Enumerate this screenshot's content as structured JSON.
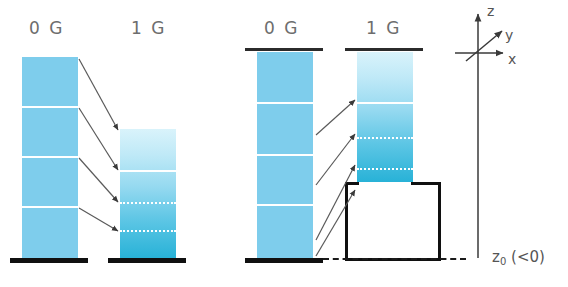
{
  "colors": {
    "zero_g_fill": "#7ecdec",
    "one_g_top": "#d9f3fb",
    "one_g_bottom": "#28b2d7",
    "divider": "#ffffff",
    "plate": "#101010",
    "label_text": "#6d6d6d",
    "axis_text": "#555555",
    "arrow": "#4a4a4a"
  },
  "panels": [
    {
      "id": "left-panel",
      "columns": [
        {
          "id": "left-0g",
          "label": "0 G",
          "style": "flat",
          "segments": 4,
          "divider_style": "solid",
          "has_top_plate": false,
          "has_base_plate": true
        },
        {
          "id": "left-1g",
          "label": "1 G",
          "style": "gradient",
          "segments": 4,
          "divider_style": "mixed",
          "has_top_plate": false,
          "has_base_plate": true
        }
      ],
      "arrows": 4
    },
    {
      "id": "right-panel",
      "columns": [
        {
          "id": "right-0g",
          "label": "0 G",
          "style": "flat",
          "segments": 4,
          "divider_style": "solid",
          "has_top_plate": true,
          "has_base_plate": true
        },
        {
          "id": "right-1g",
          "label": "1 G",
          "style": "gradient",
          "segments": 4,
          "divider_style": "mixed",
          "has_top_plate": true,
          "has_base_plate": false
        }
      ],
      "arrows": 4,
      "well": {
        "label": "trapping-box"
      }
    }
  ],
  "labels": {
    "left_zero_g": "0 G",
    "left_one_g": "1 G",
    "right_zero_g": "0 G",
    "right_one_g": "1 G",
    "z0_symbol": "z",
    "z0_subscript": "0",
    "z0_condition": "(<0)"
  },
  "axes": {
    "z": "z",
    "y": "y",
    "x": "x"
  }
}
